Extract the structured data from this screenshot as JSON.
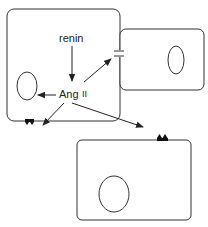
{
  "diagram": {
    "type": "cell-signaling-schematic",
    "labels": {
      "renin": "renin",
      "ang": "Ang",
      "ang_numeral": "II"
    },
    "cells": [
      {
        "id": "source-cell",
        "role": "producing cell with nucleus"
      },
      {
        "id": "adjacent-cell",
        "role": "neighboring cell connected via gap junction"
      },
      {
        "id": "distant-cell",
        "role": "target cell with surface receptors"
      }
    ],
    "arrows": [
      {
        "from": "renin",
        "to": "Ang II",
        "type": "production"
      },
      {
        "from": "Ang II",
        "to": "nucleus",
        "type": "intracrine"
      },
      {
        "from": "Ang II",
        "to": "adjacent-cell",
        "type": "juxtacrine"
      },
      {
        "from": "Ang II",
        "to": "own-membrane-receptor",
        "type": "autocrine"
      },
      {
        "from": "Ang II",
        "to": "distant-cell-receptor",
        "type": "paracrine"
      }
    ],
    "colors": {
      "stroke": "#333333",
      "background": "#ffffff"
    }
  }
}
